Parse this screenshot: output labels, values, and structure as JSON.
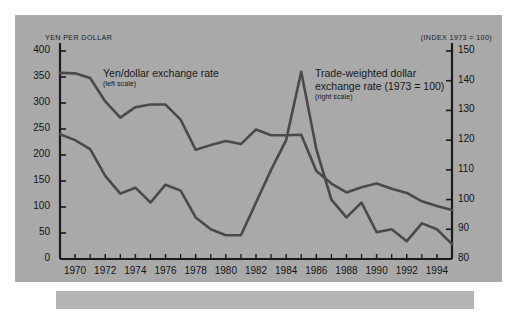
{
  "panel": {
    "background_color": "#a9a9a9",
    "page_background_color": "#ffffff",
    "line_color": "#4a4a4a",
    "axis_color": "#1a1a1a"
  },
  "axis_titles": {
    "left": "YEN PER DOLLAR",
    "right": "(INDEX 1973 = 100)"
  },
  "annotations": {
    "yen": {
      "title": "Yen/dollar exchange rate",
      "scale_note": "(left scale)"
    },
    "twd": {
      "title_line1": "Trade-weighted dollar",
      "title_line2": "exchange rate (1973 = 100)",
      "scale_note": "(right scale)"
    }
  },
  "chart_data": {
    "type": "line",
    "title": "",
    "xlabel": "",
    "ylabel": "YEN PER DOLLAR",
    "y2label": "(INDEX 1973 = 100)",
    "grid": false,
    "legend": "inline-annotations",
    "xlim": [
      1969,
      1995
    ],
    "ylim": [
      0,
      400
    ],
    "y2lim": [
      80,
      150
    ],
    "ytick_labels": [
      "0",
      "50",
      "100",
      "150",
      "200",
      "250",
      "300",
      "350",
      "400"
    ],
    "ytick_values": [
      0,
      50,
      100,
      150,
      200,
      250,
      300,
      350,
      400
    ],
    "y2tick_labels": [
      "80",
      "90",
      "100",
      "110",
      "120",
      "130",
      "140",
      "150"
    ],
    "y2tick_values": [
      80,
      90,
      100,
      110,
      120,
      130,
      140,
      150
    ],
    "xtick_labels": [
      "1970",
      "1972",
      "1974",
      "1976",
      "1978",
      "1980",
      "1982",
      "1984",
      "1986",
      "1988",
      "1990",
      "1992",
      "1994"
    ],
    "xtick_values": [
      1970,
      1972,
      1974,
      1976,
      1978,
      1980,
      1982,
      1984,
      1986,
      1988,
      1990,
      1992,
      1994
    ],
    "xtick_minor_values": [
      1969,
      1971,
      1973,
      1975,
      1977,
      1979,
      1981,
      1983,
      1985,
      1987,
      1989,
      1991,
      1993,
      1995
    ],
    "x": [
      1969,
      1970,
      1971,
      1972,
      1973,
      1974,
      1975,
      1976,
      1977,
      1978,
      1979,
      1980,
      1981,
      1982,
      1983,
      1984,
      1985,
      1986,
      1987,
      1988,
      1989,
      1990,
      1991,
      1992,
      1993,
      1994,
      1995
    ],
    "series": [
      {
        "name": "Yen/dollar exchange rate",
        "axis": "left",
        "units": "yen per dollar",
        "values": [
          358,
          357,
          348,
          303,
          272,
          292,
          297,
          297,
          268,
          210,
          219,
          227,
          221,
          249,
          238,
          238,
          239,
          169,
          145,
          128,
          138,
          145,
          135,
          127,
          111,
          102,
          94
        ]
      },
      {
        "name": "Trade-weighted dollar exchange rate (1973 = 100)",
        "axis": "right",
        "units": "index, 1973 = 100",
        "values": [
          122,
          120,
          117,
          108,
          102,
          104,
          99,
          105,
          103,
          94,
          90,
          88,
          88,
          99,
          110,
          120,
          143,
          117,
          100,
          94,
          99,
          89,
          90,
          86,
          92,
          90,
          85
        ]
      }
    ]
  }
}
